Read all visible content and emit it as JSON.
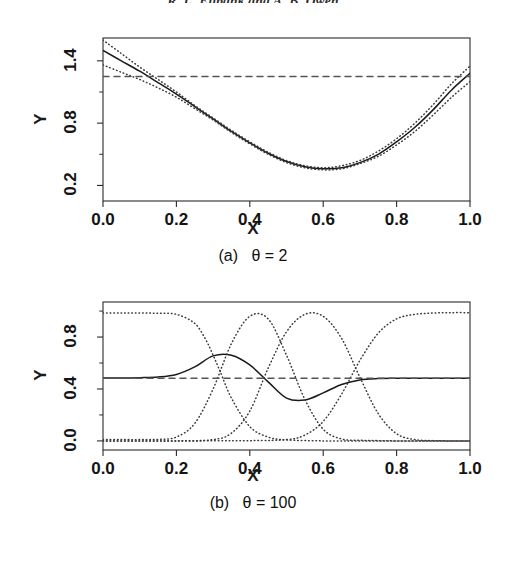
{
  "running_head": "R. L. Eubank and A. B. Owen",
  "figure": {
    "axis_y_label": "Y",
    "axis_x_label": "X"
  },
  "panels": [
    {
      "id": "a",
      "caption": "(a)   θ = 2",
      "theta_label": "θ = 2",
      "theta_value": 2,
      "panel_letter": "(a)"
    },
    {
      "id": "b",
      "caption": "(b)   θ = 100",
      "theta_label": "θ = 100",
      "theta_value": 100,
      "panel_letter": "(b)"
    }
  ],
  "colors": {
    "curve": "#1a1a1a",
    "band": "#3a3a3a",
    "reference": "#555555",
    "frame": "#2a2a2a",
    "background": "#ffffff"
  },
  "chart_data": [
    {
      "type": "line",
      "id": "panel-a",
      "title": "(a)   θ = 2",
      "xlabel": "X",
      "ylabel": "Y",
      "xlim": [
        0.0,
        1.0
      ],
      "ylim": [
        0.05,
        1.62
      ],
      "xticks": [
        "0.0",
        "0.2",
        "0.4",
        "0.6",
        "0.8",
        "1.0"
      ],
      "xtick_values": [
        0.0,
        0.2,
        0.4,
        0.6,
        0.8,
        1.0
      ],
      "yticks": [
        "0.2",
        "0.8",
        "1.4"
      ],
      "ytick_values": [
        0.2,
        0.8,
        1.4
      ],
      "grid": false,
      "legend": "none",
      "series": [
        {
          "name": "fitted curve",
          "style": "solid",
          "x": [
            0.0,
            0.05,
            0.1,
            0.15,
            0.2,
            0.25,
            0.3,
            0.35,
            0.4,
            0.45,
            0.5,
            0.55,
            0.6,
            0.65,
            0.7,
            0.75,
            0.8,
            0.85,
            0.9,
            0.95,
            1.0
          ],
          "y": [
            1.5,
            1.4,
            1.3,
            1.19,
            1.08,
            0.96,
            0.84,
            0.72,
            0.61,
            0.51,
            0.43,
            0.38,
            0.36,
            0.37,
            0.42,
            0.5,
            0.62,
            0.76,
            0.93,
            1.12,
            1.28
          ]
        },
        {
          "name": "upper confidence band",
          "style": "dotted",
          "x": [
            0.0,
            0.05,
            0.1,
            0.15,
            0.2,
            0.25,
            0.3,
            0.35,
            0.4,
            0.45,
            0.5,
            0.55,
            0.6,
            0.65,
            0.7,
            0.75,
            0.8,
            0.85,
            0.9,
            0.95,
            1.0
          ],
          "y": [
            1.6,
            1.47,
            1.34,
            1.22,
            1.1,
            0.97,
            0.85,
            0.73,
            0.62,
            0.52,
            0.44,
            0.39,
            0.37,
            0.39,
            0.44,
            0.53,
            0.65,
            0.8,
            0.98,
            1.18,
            1.35
          ]
        },
        {
          "name": "lower confidence band",
          "style": "dotted",
          "x": [
            0.0,
            0.05,
            0.1,
            0.15,
            0.2,
            0.25,
            0.3,
            0.35,
            0.4,
            0.45,
            0.5,
            0.55,
            0.6,
            0.65,
            0.7,
            0.75,
            0.8,
            0.85,
            0.9,
            0.95,
            1.0
          ],
          "y": [
            1.36,
            1.29,
            1.22,
            1.14,
            1.05,
            0.94,
            0.83,
            0.71,
            0.6,
            0.5,
            0.42,
            0.37,
            0.35,
            0.36,
            0.41,
            0.48,
            0.59,
            0.72,
            0.88,
            1.05,
            1.2
          ]
        },
        {
          "name": "reference level",
          "style": "dashed",
          "x": [
            0.0,
            1.0
          ],
          "y": [
            1.25,
            1.25
          ]
        }
      ]
    },
    {
      "type": "line",
      "id": "panel-b",
      "title": "(b)   θ = 100",
      "xlabel": "X",
      "ylabel": "Y",
      "xlim": [
        0.0,
        1.0
      ],
      "ylim": [
        -0.07,
        1.07
      ],
      "xticks": [
        "0.0",
        "0.2",
        "0.4",
        "0.6",
        "0.8",
        "1.0"
      ],
      "xtick_values": [
        0.0,
        0.2,
        0.4,
        0.6,
        0.8,
        1.0
      ],
      "yticks": [
        "0.0",
        "0.4",
        "0.8"
      ],
      "ytick_values": [
        0.0,
        0.4,
        0.8
      ],
      "grid": false,
      "legend": "none",
      "series": [
        {
          "name": "fitted curve",
          "style": "solid",
          "x": [
            0.0,
            0.05,
            0.1,
            0.15,
            0.2,
            0.25,
            0.3,
            0.35,
            0.4,
            0.45,
            0.5,
            0.55,
            0.6,
            0.65,
            0.7,
            0.75,
            0.8,
            0.85,
            0.9,
            0.95,
            1.0
          ],
          "y": [
            0.485,
            0.485,
            0.487,
            0.492,
            0.512,
            0.57,
            0.655,
            0.66,
            0.585,
            0.455,
            0.33,
            0.315,
            0.37,
            0.435,
            0.47,
            0.48,
            0.482,
            0.483,
            0.483,
            0.483,
            0.483
          ]
        },
        {
          "name": "basis function 1",
          "style": "dotted",
          "x": [
            0.0,
            0.05,
            0.1,
            0.15,
            0.2,
            0.25,
            0.28,
            0.3,
            0.32,
            0.35,
            0.4,
            0.45,
            0.5,
            0.6,
            0.7,
            0.8,
            0.9,
            1.0
          ],
          "y": [
            0.985,
            0.985,
            0.985,
            0.983,
            0.975,
            0.905,
            0.78,
            0.66,
            0.53,
            0.33,
            0.11,
            0.03,
            0.008,
            0.0,
            0.0,
            0.0,
            0.0,
            0.0
          ]
        },
        {
          "name": "basis function 2",
          "style": "dotted",
          "x": [
            0.0,
            0.05,
            0.1,
            0.15,
            0.2,
            0.25,
            0.3,
            0.35,
            0.4,
            0.45,
            0.5,
            0.55,
            0.6,
            0.65,
            0.7,
            0.75,
            0.8,
            0.85,
            0.9,
            1.0
          ],
          "y": [
            0.01,
            0.01,
            0.01,
            0.012,
            0.03,
            0.135,
            0.4,
            0.75,
            0.96,
            0.94,
            0.66,
            0.32,
            0.09,
            0.015,
            0.005,
            0.002,
            0.0,
            0.0,
            0.0,
            0.0
          ]
        },
        {
          "name": "basis function 3",
          "style": "dotted",
          "x": [
            0.0,
            0.1,
            0.2,
            0.3,
            0.35,
            0.4,
            0.45,
            0.5,
            0.55,
            0.6,
            0.65,
            0.7,
            0.75,
            0.8,
            0.85,
            0.9,
            0.95,
            1.0
          ],
          "y": [
            0.0,
            0.0,
            0.0,
            0.01,
            0.06,
            0.23,
            0.56,
            0.84,
            0.975,
            0.96,
            0.79,
            0.49,
            0.21,
            0.055,
            0.01,
            0.002,
            0.0,
            0.0
          ]
        },
        {
          "name": "basis function 4",
          "style": "dotted",
          "x": [
            0.0,
            0.2,
            0.4,
            0.5,
            0.55,
            0.6,
            0.65,
            0.7,
            0.75,
            0.8,
            0.85,
            0.9,
            0.95,
            1.0
          ],
          "y": [
            0.0,
            0.0,
            0.002,
            0.01,
            0.045,
            0.15,
            0.36,
            0.62,
            0.83,
            0.94,
            0.975,
            0.985,
            0.988,
            0.988
          ]
        },
        {
          "name": "reference level",
          "style": "dashed",
          "x": [
            0.0,
            1.0
          ],
          "y": [
            0.483,
            0.483
          ]
        }
      ]
    }
  ]
}
